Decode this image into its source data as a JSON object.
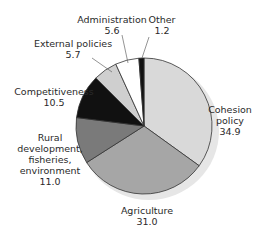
{
  "chart_data": {
    "type": "pie",
    "title": "",
    "unit": "%",
    "categories": [
      "Cohesion policy",
      "Agriculture",
      "Rural development, fisheries, environment",
      "Competitiveness",
      "External policies",
      "Administration",
      "Other"
    ],
    "values": [
      34.9,
      31.0,
      11.0,
      10.5,
      5.7,
      5.6,
      1.2
    ],
    "colors": [
      "#d9d9d9",
      "#a6a6a6",
      "#7a7a7a",
      "#111111",
      "#cfcfcf",
      "#ffffff",
      "#111111"
    ],
    "start_angle_deg": 0,
    "direction": "clockwise",
    "legend": "none (direct labels)"
  },
  "labels": {
    "cohesion": {
      "name1": "Cohesion",
      "name2": "policy",
      "value": "34.9"
    },
    "agriculture": {
      "name": "Agriculture",
      "value": "31.0"
    },
    "rural": {
      "name1": "Rural",
      "name2": "development,",
      "name3": "fisheries,",
      "name4": "environment",
      "value": "11.0"
    },
    "competitiveness": {
      "name": "Competitiveness",
      "value": "10.5"
    },
    "external": {
      "name": "External policies",
      "value": "5.7"
    },
    "administration": {
      "name": "Administration",
      "value": "5.6"
    },
    "other": {
      "name": "Other",
      "value": "1.2"
    }
  }
}
